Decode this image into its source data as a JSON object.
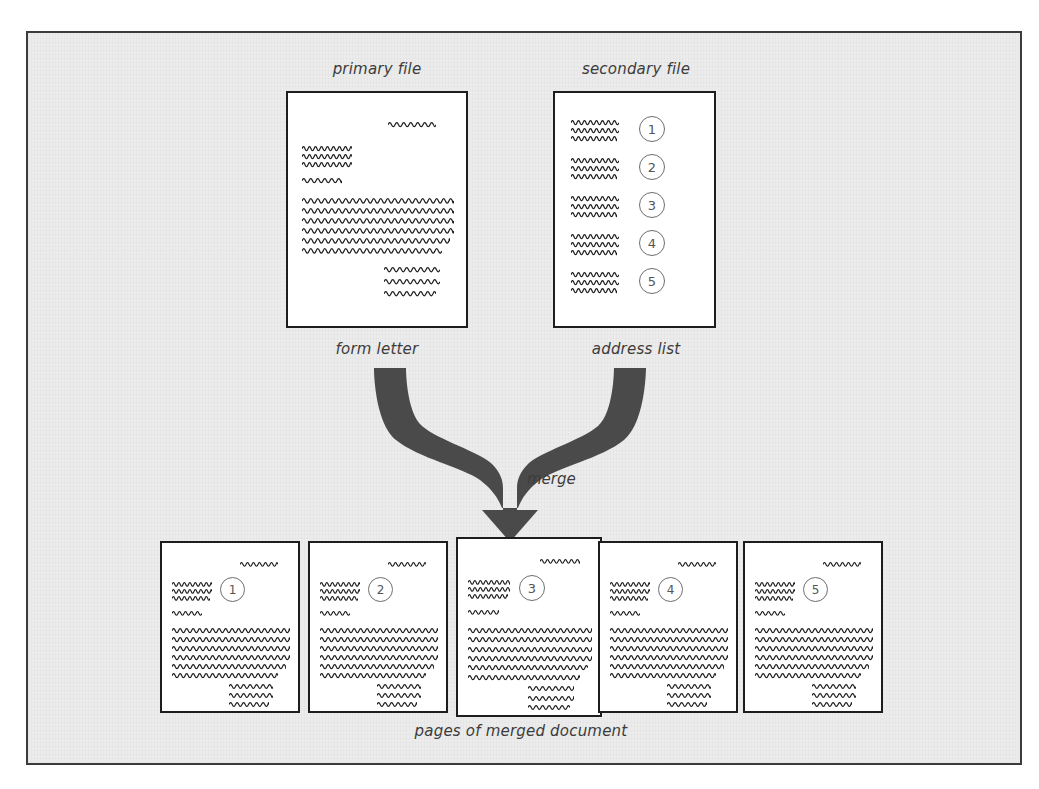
{
  "figure": {
    "type": "mail-merge-diagram",
    "background_color": "#ececec",
    "frame_border_color": "#3b3b3b",
    "ink_color": "#1d1d1d",
    "arrow_color": "#4a4a4a"
  },
  "labels": {
    "primary_file": "primary file",
    "secondary_file": "secondary file",
    "form_letter": "form letter",
    "address_list": "address list",
    "merge": "merge",
    "merged_pages": "pages of merged document"
  },
  "sources": {
    "primary": {
      "top_label": "primary file",
      "bottom_label": "form letter",
      "content_description": "form letter with date line, inside address, salutation, body paragraph and closing"
    },
    "secondary": {
      "top_label": "secondary file",
      "bottom_label": "address list",
      "content_description": "address list of five numbered records",
      "records": [
        {
          "number": "1"
        },
        {
          "number": "2"
        },
        {
          "number": "3"
        },
        {
          "number": "4"
        },
        {
          "number": "5"
        }
      ]
    }
  },
  "merged": {
    "caption": "pages of merged document",
    "pages": [
      {
        "number": "1"
      },
      {
        "number": "2"
      },
      {
        "number": "3"
      },
      {
        "number": "4"
      },
      {
        "number": "5"
      }
    ]
  },
  "icons": {
    "merge_arrow": "y-merge-arrow-icon",
    "squiggle_line": "squiggle-text-line-icon",
    "circled_number": "circled-number-icon"
  }
}
